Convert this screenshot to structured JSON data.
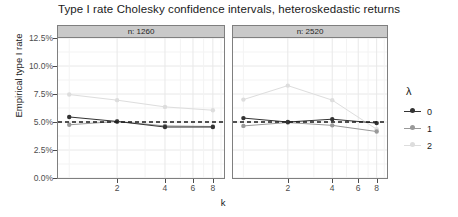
{
  "title": "Type I rate Cholesky confidence intervals, heteroskedastic returns",
  "axes": {
    "y_label": "Empirical type I rate",
    "x_label": "k",
    "y_ticks": [
      "0.0%",
      "2.5%",
      "5.0%",
      "7.5%",
      "10.0%",
      "12.5%"
    ],
    "x_ticks": [
      "2",
      "4",
      "6",
      "8"
    ]
  },
  "legend": {
    "title": "λ",
    "items": [
      {
        "label": "0",
        "color": "#333333"
      },
      {
        "label": "1",
        "color": "#999999"
      },
      {
        "label": "2",
        "color": "#dddddd"
      }
    ]
  },
  "panels": [
    {
      "strip": "n: 1260"
    },
    {
      "strip": "n: 2520"
    }
  ],
  "chart_data": {
    "type": "line",
    "title": "Type I rate Cholesky confidence intervals, heteroskedastic returns",
    "xlabel": "k",
    "ylabel": "Empirical type I rate",
    "xscale": "log2",
    "x": [
      1,
      2,
      4,
      8
    ],
    "xlim": [
      0.85,
      9.4
    ],
    "ylim": [
      0.0,
      12.5
    ],
    "ytick_values": [
      0.0,
      2.5,
      5.0,
      7.5,
      10.0,
      12.5
    ],
    "xtick_values": [
      2,
      4,
      6,
      8
    ],
    "grid": true,
    "legend_position": "right",
    "legend_title": "λ",
    "reference_line": {
      "value": 5.0,
      "style": "dashed",
      "color": "#1a1a1a"
    },
    "facets": [
      {
        "label": "n: 1260",
        "series": [
          {
            "name": "0",
            "color": "#333333",
            "values": [
              5.45,
              5.05,
              4.55,
              4.55
            ]
          },
          {
            "name": "1",
            "color": "#999999",
            "values": [
              4.75,
              5.05,
              4.65,
              4.6
            ]
          },
          {
            "name": "2",
            "color": "#dddddd",
            "values": [
              7.45,
              6.95,
              6.35,
              6.05
            ]
          }
        ]
      },
      {
        "label": "n: 2520",
        "series": [
          {
            "name": "0",
            "color": "#333333",
            "values": [
              5.35,
              5.0,
              5.25,
              4.9
            ]
          },
          {
            "name": "1",
            "color": "#999999",
            "values": [
              4.65,
              4.95,
              4.7,
              4.15
            ]
          },
          {
            "name": "2",
            "color": "#dddddd",
            "values": [
              7.0,
              8.25,
              6.95,
              4.35
            ]
          }
        ]
      }
    ]
  }
}
